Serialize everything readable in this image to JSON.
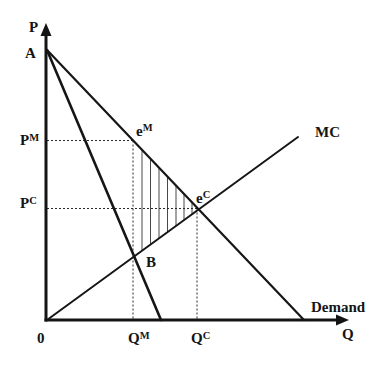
{
  "axes": {
    "y_label": "P",
    "x_label": "Q",
    "origin_label": "0"
  },
  "points": {
    "A": "A",
    "B": "B",
    "eM": {
      "base": "e",
      "sup": "M"
    },
    "eC": {
      "base": "e",
      "sup": "C"
    }
  },
  "price_levels": {
    "monopoly": {
      "base": "P",
      "sup": "M"
    },
    "competitive": {
      "base": "P",
      "sup": "C"
    }
  },
  "quantity_levels": {
    "monopoly": {
      "base": "Q",
      "sup": "M"
    },
    "competitive": {
      "base": "Q",
      "sup": "C"
    }
  },
  "curves": {
    "mc": "MC",
    "demand": "Demand"
  },
  "colors": {
    "ink": "#141414",
    "background": "#ffffff"
  }
}
